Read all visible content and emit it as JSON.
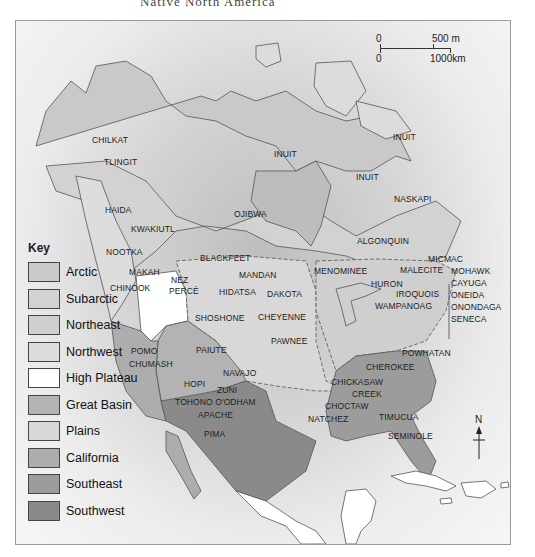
{
  "caption": "Native North America",
  "scale_bar": {
    "top_zero": "0",
    "top_value": "500 m",
    "bottom_zero": "0",
    "bottom_value": "1000km"
  },
  "north_arrow": {
    "label": "N"
  },
  "key": {
    "title": "Key",
    "items": [
      {
        "label": "Arctic",
        "color": "#c9c9c9"
      },
      {
        "label": "Subarctic",
        "color": "#d2d2d2"
      },
      {
        "label": "Northeast",
        "color": "#cfcfcf"
      },
      {
        "label": "Northwest",
        "color": "#dddddd"
      },
      {
        "label": "High Plateau",
        "color": "#ffffff"
      },
      {
        "label": "Great Basin",
        "color": "#b3b3b3"
      },
      {
        "label": "Plains",
        "color": "#d8d8d8"
      },
      {
        "label": "California",
        "color": "#adadad"
      },
      {
        "label": "Southeast",
        "color": "#9c9c9c"
      },
      {
        "label": "Southwest",
        "color": "#8a8a8a"
      }
    ]
  },
  "tribes": {
    "inuit_1": "INUIT",
    "inuit_2": "INUIT",
    "inuit_3": "INUIT",
    "chilkat": "CHILKAT",
    "tlingit": "TLINGIT",
    "haida": "HAIDA",
    "kwakiutl": "KWAKIUTL",
    "ojibwa": "OJIBWA",
    "naskapi": "NASKAPI",
    "algonquin": "ALGONQUIN",
    "nootka": "NOOTKA",
    "makah": "MAKAH",
    "chinook": "CHINOOK",
    "nez_perce_1": "NEZ",
    "nez_perce_2": "PERCÉ",
    "blackfeet": "BLACKFEET",
    "mandan": "MANDAN",
    "hidatsa": "HIDATSA",
    "dakota": "DAKOTA",
    "menominee": "MENOMINEE",
    "micmac": "MICMAC",
    "malecite": "MALECITE",
    "huron": "HURON",
    "iroquois": "IROQUOIS",
    "wampanoag": "WAMPANOAG",
    "mohawk": "MOHAWK",
    "cayuga": "CAYUGA",
    "oneida": "ONEIDA",
    "onondaga": "ONONDAGA",
    "seneca": "SENECA",
    "shoshone": "SHOSHONE",
    "cheyenne": "CHEYENNE",
    "pawnee": "PAWNEE",
    "pomo": "POMO",
    "chumash": "CHUMASH",
    "paiute": "PAIUTE",
    "navajo": "NAVAJO",
    "hopi": "HOPI",
    "zuni": "ZUNI",
    "tohono": "TOHONO O'ODHAM",
    "apache": "APACHE",
    "pima": "PIMA",
    "powhatan": "POWHATAN",
    "cherokee": "CHEROKEE",
    "chickasaw": "CHICKASAW",
    "creek": "CREEK",
    "choctaw": "CHOCTAW",
    "natchez": "NATCHEZ",
    "timucua": "TIMUCUA",
    "seminole": "SEMINOLE"
  }
}
